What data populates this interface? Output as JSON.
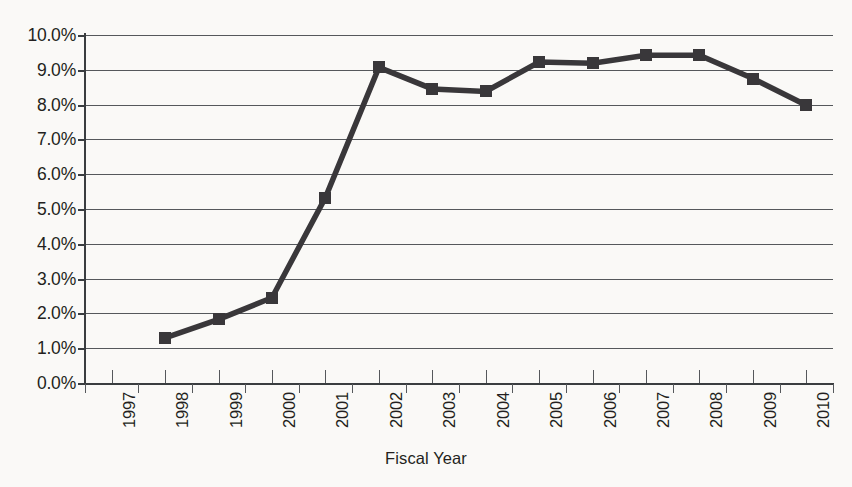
{
  "chart_data": {
    "type": "line",
    "title": "",
    "xlabel": "Fiscal Year",
    "ylabel": "",
    "categories": [
      "1997",
      "1998",
      "1999",
      "2000",
      "2001",
      "2002",
      "2003",
      "2004",
      "2005",
      "2006",
      "2007",
      "2008",
      "2009",
      "2010"
    ],
    "series": [
      {
        "name": "",
        "values": [
          null,
          1.3,
          1.83,
          2.45,
          5.33,
          9.07,
          8.45,
          8.38,
          9.22,
          9.19,
          9.42,
          9.42,
          8.75,
          7.98
        ]
      }
    ],
    "ylim": [
      0.0,
      10.0
    ],
    "ytick_values": [
      0.0,
      1.0,
      2.0,
      3.0,
      4.0,
      5.0,
      6.0,
      7.0,
      8.0,
      9.0,
      10.0
    ],
    "ytick_labels": [
      "0.0%",
      "1.0%",
      "2.0%",
      "3.0%",
      "4.0%",
      "5.0%",
      "6.0%",
      "7.0%",
      "8.0%",
      "9.0%",
      "10.0%"
    ],
    "grid": true,
    "grid_axis": "y",
    "legend": false,
    "legend_position": "none",
    "marker": "square",
    "line_color": "#39373a",
    "marker_color": "#39373a",
    "grid_color": "#55585c",
    "axis_color": "#3a3d40",
    "background_color": "#faf9f7",
    "annotations": []
  },
  "axis": {
    "x_title": "Fiscal Year"
  }
}
